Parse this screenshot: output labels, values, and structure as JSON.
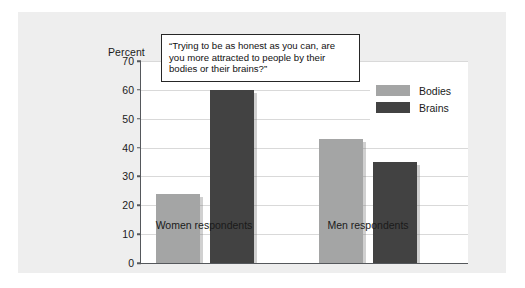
{
  "chart_data": {
    "type": "bar",
    "title": "",
    "subtitle": "",
    "annotation": "“Trying to be as honest as you can, are you more attracted to people by their bodies or their brains?”",
    "categories": [
      "Women respondents",
      "Men respondents"
    ],
    "series": [
      {
        "name": "Bodies",
        "values": [
          24,
          43
        ],
        "color": "#a4a5a5"
      },
      {
        "name": "Brains",
        "values": [
          60,
          35
        ],
        "color": "#424242"
      }
    ],
    "xlabel": "",
    "ylabel": "Percent",
    "ylim": [
      0,
      70
    ],
    "ytick_step": 10,
    "yticks": [
      0,
      10,
      20,
      30,
      40,
      50,
      60,
      70
    ],
    "ytick_labels": [
      "0",
      "10",
      "20",
      "30",
      "40",
      "50",
      "60",
      "70"
    ],
    "grid": "horizontal",
    "legend_position": "top-right",
    "legend_entries": [
      "Bodies",
      "Brains"
    ]
  },
  "figure": {
    "background_color": "#eeeeee",
    "plot_background_color": "#ffffff",
    "axis_color": "#55585c",
    "gridline_color": "#d9d9d9"
  }
}
